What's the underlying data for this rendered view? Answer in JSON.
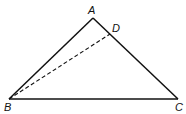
{
  "diagram": {
    "type": "triangle",
    "points": {
      "A": {
        "label": "A",
        "x": 93,
        "y": 18
      },
      "B": {
        "label": "B",
        "x": 9,
        "y": 99
      },
      "C": {
        "label": "C",
        "x": 178,
        "y": 99
      },
      "D": {
        "label": "D",
        "x": 110,
        "y": 34
      }
    },
    "segments": [
      {
        "from": "A",
        "to": "B",
        "style": "solid"
      },
      {
        "from": "A",
        "to": "C",
        "style": "solid"
      },
      {
        "from": "B",
        "to": "C",
        "style": "solid"
      },
      {
        "from": "B",
        "to": "D",
        "style": "dashed"
      }
    ],
    "colors": {
      "stroke": "#111111",
      "background": "#ffffff"
    }
  }
}
